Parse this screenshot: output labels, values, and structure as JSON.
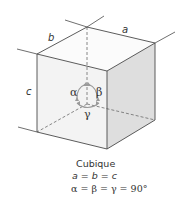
{
  "diagram": {
    "type": "crystal-system-unit-cell",
    "colors": {
      "edge": "#4a4a4a",
      "hidden_edge": "#6a6a6a",
      "top_face": "#fbfbfb",
      "front_face": "#f3f3f3",
      "right_face": "#dedede",
      "angle_arrow": "#9a9a9a"
    },
    "labels": {
      "edge_a": "a",
      "edge_b": "b",
      "edge_c": "c",
      "angle_alpha": "α",
      "angle_beta": "β",
      "angle_gamma": "γ"
    }
  },
  "caption": {
    "title": "Cubique",
    "lengths": "a = b = c",
    "angles": "α = β = γ = 90°"
  }
}
